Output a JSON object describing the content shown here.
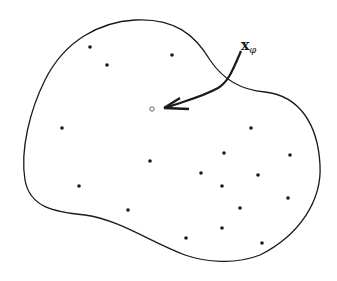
{
  "diagram": {
    "region_outline": "closed blob boundary",
    "label": {
      "main": "x",
      "subscript": "φ"
    },
    "colors": {
      "ink": "#1a1a1a",
      "background": "#ffffff"
    },
    "query_point": {
      "x": 152,
      "y": 109,
      "style": "open-circle"
    },
    "arrow": {
      "from": [
        241,
        51
      ],
      "to": [
        164,
        108
      ]
    },
    "points": [
      [
        90,
        47
      ],
      [
        107,
        65
      ],
      [
        172,
        55
      ],
      [
        62,
        128
      ],
      [
        251,
        128
      ],
      [
        150,
        161
      ],
      [
        224,
        153
      ],
      [
        290,
        155
      ],
      [
        201,
        173
      ],
      [
        258,
        175
      ],
      [
        79,
        186
      ],
      [
        222,
        186
      ],
      [
        288,
        198
      ],
      [
        240,
        208
      ],
      [
        128,
        210
      ],
      [
        222,
        228
      ],
      [
        186,
        238
      ],
      [
        262,
        243
      ]
    ]
  }
}
